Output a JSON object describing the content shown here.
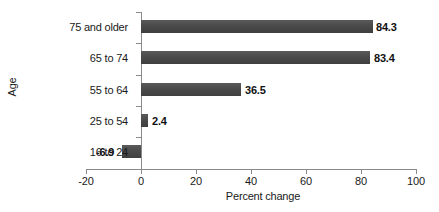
{
  "chart_data": {
    "type": "bar",
    "orientation": "horizontal",
    "title": "",
    "xlabel": "Percent change",
    "ylabel": "Age",
    "categories": [
      "16 to 24",
      "25 to 54",
      "55 to 64",
      "65 to 74",
      "75 and older"
    ],
    "values": [
      -6.9,
      2.4,
      36.5,
      83.4,
      84.3
    ],
    "data_labels": [
      "-6.9",
      "2.4",
      "36.5",
      "83.4",
      "84.3"
    ],
    "xlim": [
      -20,
      100
    ],
    "xticks": [
      -20,
      0,
      20,
      40,
      60,
      80,
      100
    ],
    "xtick_labels": [
      "-20",
      "0",
      "20",
      "40",
      "60",
      "80",
      "100"
    ],
    "grid": false,
    "legend": null,
    "bar_color": "#4a4a4a",
    "axis_color": "#8a8a8a",
    "text_color": "#1a1a1a"
  },
  "bars": [
    {
      "category": "75 and older",
      "value": 84.3,
      "label": "84.3",
      "bar_left": 141,
      "bar_width": 232,
      "bar_top": 20,
      "label_left": 376,
      "label_top": 21,
      "cat_label_left": 18,
      "cat_label_top": 21,
      "tick_top": 12
    },
    {
      "category": "65 to 74",
      "value": 83.4,
      "label": "83.4",
      "bar_left": 141,
      "bar_width": 229,
      "bar_top": 51,
      "label_left": 374,
      "label_top": 52,
      "cat_label_left": 18,
      "cat_label_top": 52,
      "tick_top": 43
    },
    {
      "category": "55 to 64",
      "value": 36.5,
      "label": "36.5",
      "bar_left": 141,
      "bar_width": 100,
      "bar_top": 83,
      "label_left": 245,
      "label_top": 84,
      "cat_label_left": 18,
      "cat_label_top": 84,
      "tick_top": 75
    },
    {
      "category": "25 to 54",
      "value": 2.4,
      "label": "2.4",
      "bar_left": 141,
      "bar_width": 7,
      "bar_top": 114,
      "label_left": 152,
      "label_top": 115,
      "cat_label_left": 18,
      "cat_label_top": 115,
      "tick_top": 106
    },
    {
      "category": "16 to 24",
      "value": -6.9,
      "label": "-6.9",
      "bar_left": 122,
      "bar_width": 19,
      "bar_top": 145,
      "label_left": 96,
      "label_top": 146,
      "cat_label_left": 18,
      "cat_label_top": 146,
      "tick_top": 137
    }
  ],
  "xticks": [
    {
      "label": "-20",
      "x": 86
    },
    {
      "label": "0",
      "x": 141
    },
    {
      "label": "20",
      "x": 196
    },
    {
      "label": "40",
      "x": 251
    },
    {
      "label": "60",
      "x": 306
    },
    {
      "label": "80",
      "x": 361
    },
    {
      "label": "100",
      "x": 416
    }
  ],
  "extra_ticks": [
    {
      "tick_top": 169
    }
  ]
}
